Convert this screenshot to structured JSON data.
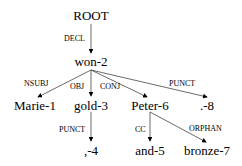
{
  "nodes": {
    "root": "ROOT",
    "won": "won-2",
    "marie": "Marie-1",
    "gold": "gold-3",
    "peter": "Peter-6",
    "punct8": ".-8",
    "comma4": ",-4",
    "and5": "and-5",
    "bronze7": "bronze-7"
  },
  "edges": {
    "decl": "DECL",
    "nsubj": "NSUBJ",
    "obj": "OBJ",
    "conj": "CONJ",
    "punct_top": "PUNCT",
    "punct_gold": "PUNCT",
    "cc": "CC",
    "orphan": "ORPHAN"
  }
}
